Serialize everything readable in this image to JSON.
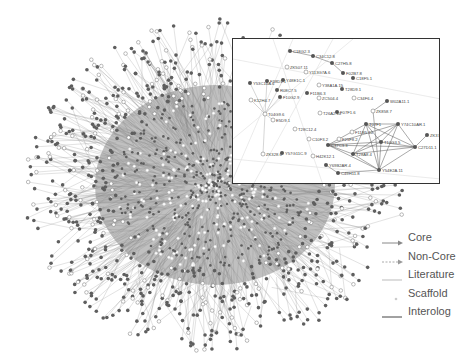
{
  "figure": {
    "type": "protein interaction network",
    "main_network": {
      "description": "large hairball network of nodes and edges",
      "node_colors": {
        "filled": "#666666",
        "open": "#ffffff",
        "core_center": "#ffffff"
      },
      "edge_color": "#8a8a8a"
    },
    "inset": {
      "description": "zoomed subnetwork",
      "nodes": [
        {
          "id": "C18G2.3",
          "x": 57,
          "y": 12,
          "filled": true
        },
        {
          "id": "C34C12.8",
          "x": 80,
          "y": 17,
          "filled": true
        },
        {
          "id": "C27H5.8",
          "x": 99,
          "y": 24,
          "filled": true
        },
        {
          "id": "ZK507.11",
          "x": 54,
          "y": 28,
          "filled": false
        },
        {
          "id": "Y113G7A.6",
          "x": 73,
          "y": 33,
          "filled": false
        },
        {
          "id": "F02B7.8",
          "x": 110,
          "y": 34,
          "filled": true
        },
        {
          "id": "C18F5.1",
          "x": 120,
          "y": 39,
          "filled": true
        },
        {
          "id": "Y53C10A.6",
          "x": 17,
          "y": 44,
          "filled": true
        },
        {
          "id": "F38D1.1",
          "x": 34,
          "y": 42,
          "filled": true
        },
        {
          "id": "Y48E1C.1",
          "x": 50,
          "y": 41,
          "filled": true
        },
        {
          "id": "Y38A1A.15",
          "x": 86,
          "y": 46,
          "filled": false
        },
        {
          "id": "R08C7.5",
          "x": 44,
          "y": 51,
          "filled": true
        },
        {
          "id": "T28D9.1",
          "x": 109,
          "y": 50,
          "filled": true
        },
        {
          "id": "K12H4.7",
          "x": 18,
          "y": 61,
          "filled": false
        },
        {
          "id": "F10G2.9",
          "x": 47,
          "y": 58,
          "filled": true
        },
        {
          "id": "F11B6.3",
          "x": 74,
          "y": 54,
          "filled": true
        },
        {
          "id": "ZC504.4",
          "x": 86,
          "y": 59,
          "filled": false
        },
        {
          "id": "C34F6.4",
          "x": 121,
          "y": 59,
          "filled": false
        },
        {
          "id": "W02A11.1",
          "x": 154,
          "y": 62,
          "filled": true
        },
        {
          "id": "T04G9.6",
          "x": 32,
          "y": 75,
          "filled": false
        },
        {
          "id": "ZK858.7",
          "x": 140,
          "y": 72,
          "filled": false
        },
        {
          "id": "F07F1.6",
          "x": 104,
          "y": 73,
          "filled": true
        },
        {
          "id": "T26A2.10",
          "x": 87,
          "y": 74,
          "filled": false
        },
        {
          "id": "E5D9.1",
          "x": 40,
          "y": 81,
          "filled": false
        },
        {
          "id": "T07F1",
          "x": 133,
          "y": 85,
          "filled": true
        },
        {
          "id": "Y74C10AR.1",
          "x": 165,
          "y": 85,
          "filled": true
        },
        {
          "id": "T28C12.4",
          "x": 62,
          "y": 90,
          "filled": false
        },
        {
          "id": "F11B5.10",
          "x": 119,
          "y": 93,
          "filled": false
        },
        {
          "id": "ZK370.3",
          "x": 194,
          "y": 96,
          "filled": true
        },
        {
          "id": "C10F3.2",
          "x": 76,
          "y": 100,
          "filled": false
        },
        {
          "id": "F25F8.2",
          "x": 106,
          "y": 100,
          "filled": false
        },
        {
          "id": "C37C3.3",
          "x": 95,
          "y": 106,
          "filled": true
        },
        {
          "id": "T10G3.5",
          "x": 148,
          "y": 103,
          "filled": true
        },
        {
          "id": "C27D11.1",
          "x": 182,
          "y": 108,
          "filled": true
        },
        {
          "id": "ZK328.6",
          "x": 30,
          "y": 115,
          "filled": false
        },
        {
          "id": "Y57G11C.9",
          "x": 49,
          "y": 114,
          "filled": true
        },
        {
          "id": "H42K12.1",
          "x": 80,
          "y": 117,
          "filled": false
        },
        {
          "id": "T28A8.4",
          "x": 120,
          "y": 115,
          "filled": true
        },
        {
          "id": "Y69B2AR.4",
          "x": 93,
          "y": 126,
          "filled": true
        },
        {
          "id": "C49H11.8",
          "x": 105,
          "y": 134,
          "filled": true
        },
        {
          "id": "Y54E2A.11",
          "x": 146,
          "y": 131,
          "filled": true
        }
      ]
    },
    "legend": {
      "items": [
        {
          "label": "Core",
          "style": "solid-arrow",
          "color": "#888888"
        },
        {
          "label": "Non-Core",
          "style": "dashed-arrow",
          "color": "#aaaaaa"
        },
        {
          "label": "Literature",
          "style": "light-line",
          "color": "#bbbbbb"
        },
        {
          "label": "Scaffold",
          "style": "dot",
          "color": "#cccccc"
        },
        {
          "label": "Interolog",
          "style": "dark-line",
          "color": "#444444"
        }
      ]
    }
  }
}
